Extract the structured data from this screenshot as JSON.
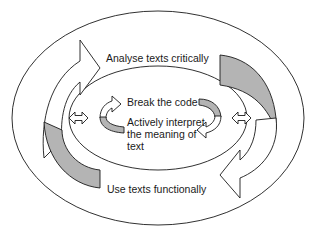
{
  "diagram": {
    "type": "concentric cycle diagram",
    "rings": [
      {
        "id": "outer",
        "label": "Analyse texts critically",
        "arrow_direction": "clockwise"
      },
      {
        "id": "outer-bottom",
        "label": "Use texts functionally",
        "arrow_direction": "clockwise"
      },
      {
        "id": "inner-top",
        "label": "Break the code",
        "arrow_direction": "clockwise"
      },
      {
        "id": "inner-bottom",
        "label": "Actively interpret the meaning of text",
        "arrow_direction": "clockwise"
      }
    ],
    "labels": {
      "analyse": "Analyse texts critically",
      "break_code": "Break the code",
      "interpret_line1": "Actively interpret",
      "interpret_line2": "the meaning of",
      "interpret_line3": "text",
      "use": "Use texts functionally"
    },
    "connectors": [
      {
        "name": "left-double-arrow",
        "type": "double-headed arrow"
      },
      {
        "name": "right-double-arrow",
        "type": "double-headed arrow"
      }
    ],
    "colors": {
      "stroke": "#1a1a1a",
      "shade": "#b4b4b4",
      "background": "#ffffff"
    }
  }
}
